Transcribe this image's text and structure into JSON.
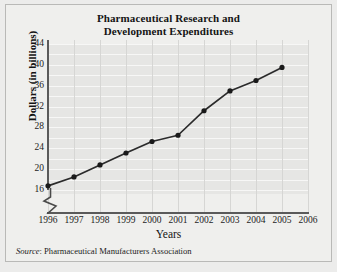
{
  "chart_data": {
    "type": "line",
    "title": "Pharmaceutical Research and Development Expenditures",
    "title_line1": "Pharmaceutical Research and",
    "title_line2": "Development Expenditures",
    "xlabel": "Years",
    "ylabel": "Dollars (in billions)",
    "xtick_labels": [
      "1996",
      "1997",
      "1998",
      "1999",
      "2000",
      "2001",
      "2002",
      "2003",
      "2004",
      "2005",
      "2006"
    ],
    "ytick_labels": [
      "16",
      "20",
      "24",
      "28",
      "32",
      "36",
      "40",
      "44"
    ],
    "xlim": [
      1996,
      2006
    ],
    "ylim": [
      16,
      44
    ],
    "y_axis_break": true,
    "grid": true,
    "legend": "none",
    "marker": "filled-circle",
    "line_color": "#2b2b2b",
    "marker_color": "#1a1a1a",
    "plot_background": "#e6e6e4",
    "categories": [
      1996,
      1997,
      1998,
      1999,
      2000,
      2001,
      2002,
      2003,
      2004,
      2005
    ],
    "values": [
      16.8,
      18.5,
      20.8,
      23.1,
      25.3,
      26.5,
      31.2,
      35.0,
      37.0,
      39.5
    ],
    "series": [
      {
        "name": "R&D Expenditures",
        "points": [
          {
            "x": 1996,
            "y": 16.8
          },
          {
            "x": 1997,
            "y": 18.5
          },
          {
            "x": 1998,
            "y": 20.8
          },
          {
            "x": 1999,
            "y": 23.1
          },
          {
            "x": 2000,
            "y": 25.3
          },
          {
            "x": 2001,
            "y": 26.5
          },
          {
            "x": 2002,
            "y": 31.2
          },
          {
            "x": 2003,
            "y": 35.0
          },
          {
            "x": 2004,
            "y": 37.0
          },
          {
            "x": 2005,
            "y": 39.5
          }
        ]
      }
    ]
  },
  "source": {
    "label": "Source",
    "separator": ": ",
    "text": "Pharmaceutical Manufacturers Association",
    "full": "Source: Pharmaceutical Manufacturers Association"
  }
}
